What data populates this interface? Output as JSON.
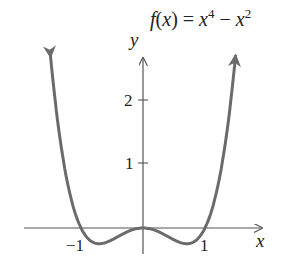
{
  "chart_data": {
    "type": "line",
    "title_parts": {
      "f": "f",
      "open": "(",
      "x": "x",
      "close": ") = ",
      "x1": "x",
      "exp1": "4",
      "minus": " − ",
      "x2": "x",
      "exp2": "2"
    },
    "xlabel": "x",
    "ylabel": "y",
    "xticks": [
      {
        "value": -1,
        "label": "−1"
      },
      {
        "value": 1,
        "label": "1"
      }
    ],
    "yticks": [
      {
        "value": 1,
        "label": "1"
      },
      {
        "value": 2,
        "label": "2"
      }
    ],
    "xlim": [
      -1.9,
      1.9
    ],
    "ylim": [
      -0.4,
      2.9
    ],
    "grid": false,
    "series": [
      {
        "name": "f(x) = x^4 − x^2",
        "function": "x^4 - x^2",
        "x": [
          -1.53,
          -1.4,
          -1.2,
          -1.0,
          -0.9,
          -0.707,
          -0.5,
          -0.3,
          0,
          0.3,
          0.5,
          0.707,
          0.9,
          1.0,
          1.2,
          1.4,
          1.53
        ],
        "values": [
          3.14,
          1.88,
          0.63,
          0,
          -0.15,
          -0.25,
          -0.19,
          -0.08,
          0,
          -0.08,
          -0.19,
          -0.25,
          -0.15,
          0,
          0.63,
          1.88,
          3.14
        ],
        "color": "#6b6b6b"
      }
    ],
    "axis_color": "#555555"
  }
}
